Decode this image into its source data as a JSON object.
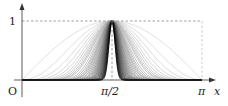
{
  "chart_data": {
    "type": "line",
    "title": "",
    "xlabel": "x",
    "ylabel": "",
    "xlim": [
      0,
      3.14159
    ],
    "ylim": [
      0,
      1
    ],
    "x_ticks": [
      "O",
      "π/2",
      "π"
    ],
    "y_ticks": [
      "1"
    ],
    "exponents": [
      1,
      2,
      3,
      4,
      5,
      6,
      7,
      8,
      9,
      10,
      12,
      14,
      16,
      18,
      20,
      23,
      26,
      30,
      34,
      38,
      43,
      48,
      54,
      60,
      67,
      75,
      84,
      94,
      105,
      118,
      132,
      148,
      165,
      185,
      207,
      232,
      260,
      290,
      325,
      364
    ],
    "grid": false,
    "legend": null,
    "annotations": [
      "dashed line at y = 1",
      "dashed line at x = π/2"
    ]
  },
  "labels": {
    "origin": "O",
    "y_one": "1",
    "x_half_pi": "π/2",
    "x_pi": "π",
    "x_axis": "x"
  },
  "colors": {
    "axis": "#333333",
    "curve_light": "#cccccc",
    "curve_dark": "#000000",
    "dashed": "#777777"
  }
}
